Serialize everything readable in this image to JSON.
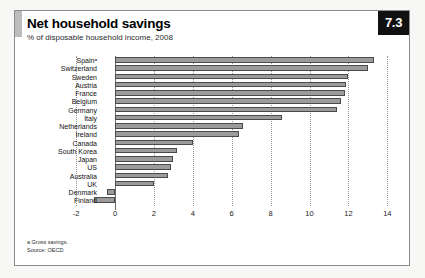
{
  "badge": {
    "number": "7.3"
  },
  "header": {
    "title": "Net household savings",
    "subtitle": "% of disposable household income, 2008"
  },
  "footnotes": {
    "note_a": "a Gross savings.",
    "source": "Source: OECD"
  },
  "chart_data": {
    "type": "bar",
    "orientation": "horizontal",
    "title": "Net household savings",
    "subtitle": "% of disposable household income, 2008",
    "xlabel": "",
    "ylabel": "",
    "xlim": [
      -2,
      14
    ],
    "xticks": [
      -2,
      0,
      2,
      4,
      6,
      8,
      10,
      12,
      14
    ],
    "xtick_labels": [
      "-2",
      "0",
      "2",
      "4",
      "6",
      "8",
      "10",
      "12",
      "14"
    ],
    "grid": true,
    "legend": false,
    "bar_color": "#9b9b9b",
    "bar_border_color": "#4a4a4a",
    "categories": [
      "Spainᵃ",
      "Switzerland",
      "Sweden",
      "Austria",
      "France",
      "Belgium",
      "Germany",
      "Italy",
      "Netherlands",
      "Ireland",
      "Canada",
      "South Korea",
      "Japan",
      "US",
      "Australia",
      "UK",
      "Denmark",
      "Finland"
    ],
    "values": [
      13.3,
      13.0,
      12.0,
      11.9,
      11.8,
      11.6,
      11.4,
      8.6,
      6.6,
      6.4,
      4.0,
      3.2,
      3.0,
      2.9,
      2.7,
      2.0,
      -0.4,
      -1.1
    ]
  }
}
